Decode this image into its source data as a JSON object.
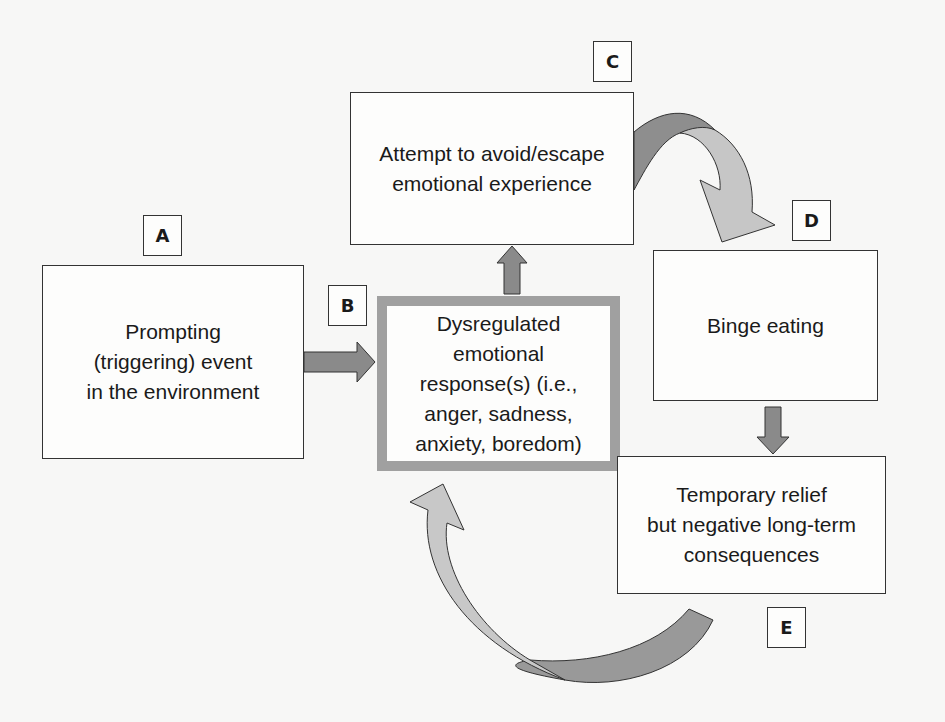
{
  "diagram": {
    "nodes": [
      {
        "id": "A",
        "label": "A",
        "text": "Prompting\n(triggering) event\nin the environment"
      },
      {
        "id": "B",
        "label": "B",
        "text": "Dysregulated\nemotional\nresponse(s) (i.e.,\nanger, sadness,\nanxiety, boredom)"
      },
      {
        "id": "C",
        "label": "C",
        "text": "Attempt to avoid/escape\nemotional experience"
      },
      {
        "id": "D",
        "label": "D",
        "text": "Binge eating"
      },
      {
        "id": "E",
        "label": "E",
        "text": "Temporary relief\nbut negative long-term\nconsequences"
      }
    ],
    "edges": [
      {
        "from": "A",
        "to": "B",
        "style": "straight-arrow"
      },
      {
        "from": "B",
        "to": "C",
        "style": "straight-arrow"
      },
      {
        "from": "C",
        "to": "D",
        "style": "curved-arrow"
      },
      {
        "from": "D",
        "to": "E",
        "style": "straight-arrow"
      },
      {
        "from": "E",
        "to": "B",
        "style": "curved-arrow"
      }
    ],
    "colors": {
      "arrow_dark": "#8a8a8a",
      "arrow_light": "#c4c4c4",
      "highlight_border": "#a0a0a0",
      "box_border": "#333333"
    }
  }
}
